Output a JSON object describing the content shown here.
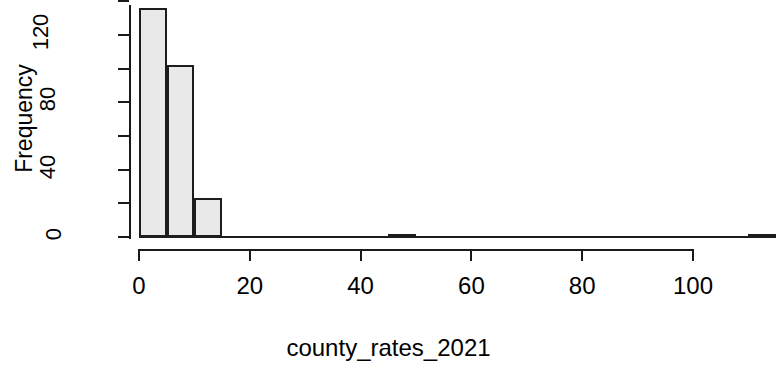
{
  "chart_data": {
    "type": "bar",
    "title": "",
    "subtitle": "",
    "xlabel": "county_rates_2021",
    "ylabel": "Frequency",
    "grid": false,
    "legend": null,
    "xlim": [
      0,
      115
    ],
    "ylim": [
      0,
      140
    ],
    "x_ticks": [
      0,
      20,
      40,
      60,
      80,
      100
    ],
    "x_tick_labels": [
      "0",
      "20",
      "40",
      "60",
      "80",
      "100"
    ],
    "y_ticks": [
      0,
      20,
      40,
      60,
      80,
      100,
      120,
      140
    ],
    "y_tick_labels_shown": [
      "0",
      "40",
      "80",
      "120"
    ],
    "y_labeled_ticks": [
      0,
      40,
      80,
      120
    ],
    "bin_width": 5,
    "bins": [
      {
        "x0": 0,
        "x1": 5,
        "count": 136
      },
      {
        "x0": 5,
        "x1": 10,
        "count": 102
      },
      {
        "x0": 10,
        "x1": 15,
        "count": 23
      },
      {
        "x0": 45,
        "x1": 50,
        "count": 1
      },
      {
        "x0": 110,
        "x1": 115,
        "count": 1
      }
    ],
    "categories": [
      "0-5",
      "5-10",
      "10-15",
      "45-50",
      "110-115"
    ],
    "values": [
      136,
      102,
      23,
      1,
      1
    ],
    "bar_fill_color": "#e9e9e9",
    "bar_border_color": "#1d1d1d",
    "axis_color": "#1a1a1a",
    "background_color": "#ffffff"
  },
  "axes": {
    "y_title": "Frequency",
    "x_title": "county_rates_2021"
  }
}
